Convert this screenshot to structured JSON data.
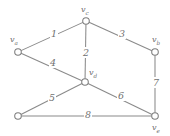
{
  "figure": {
    "kind": "weighted-undirected-graph",
    "background_color": "#ffffff",
    "stroke_color": "#8a8a8a",
    "text_color": "#6f6f6f",
    "width": 170,
    "height": 136
  },
  "vertices": [
    {
      "id": "vc",
      "label_prefix": "v",
      "label_sub": "c",
      "x": 86,
      "y": 21,
      "has_label": true
    },
    {
      "id": "va",
      "label_prefix": "v",
      "label_sub": "a",
      "x": 18,
      "y": 52,
      "has_label": true
    },
    {
      "id": "vb",
      "label_prefix": "v",
      "label_sub": "b",
      "x": 155,
      "y": 52,
      "has_label": true
    },
    {
      "id": "vd",
      "label_prefix": "v",
      "label_sub": "d",
      "x": 85,
      "y": 82,
      "has_label": true
    },
    {
      "id": "vg",
      "label_prefix": "",
      "label_sub": "",
      "x": 18,
      "y": 116,
      "has_label": false
    },
    {
      "id": "ve",
      "label_prefix": "v",
      "label_sub": "e",
      "x": 155,
      "y": 116,
      "has_label": true
    }
  ],
  "vertex_labels": {
    "vc": {
      "text": "v",
      "sub": "c",
      "x": 81,
      "y": 6
    },
    "va": {
      "text": "v",
      "sub": "a",
      "x": 10,
      "y": 36
    },
    "vb": {
      "text": "v",
      "sub": "b",
      "x": 152,
      "y": 36
    },
    "vd": {
      "text": "v",
      "sub": "d",
      "x": 89,
      "y": 69
    },
    "ve": {
      "text": "v",
      "sub": "e",
      "x": 152,
      "y": 124
    }
  },
  "edges": [
    {
      "id": "e1",
      "from": "va",
      "to": "vc",
      "weight": "1",
      "label_x": 50,
      "label_y": 29
    },
    {
      "id": "e2",
      "from": "vc",
      "to": "vd",
      "weight": "2",
      "label_x": 82,
      "label_y": 48
    },
    {
      "id": "e3",
      "from": "vc",
      "to": "vb",
      "weight": "3",
      "label_x": 118,
      "label_y": 29
    },
    {
      "id": "e4",
      "from": "va",
      "to": "vd",
      "weight": "4",
      "label_x": 49,
      "label_y": 58
    },
    {
      "id": "e5",
      "from": "vg",
      "to": "vd",
      "weight": "5",
      "label_x": 48,
      "label_y": 93
    },
    {
      "id": "e6",
      "from": "vd",
      "to": "ve",
      "weight": "6",
      "label_x": 117,
      "label_y": 91
    },
    {
      "id": "e7",
      "from": "vb",
      "to": "ve",
      "weight": "7",
      "label_x": 152,
      "label_y": 78
    },
    {
      "id": "e8",
      "from": "vg",
      "to": "ve",
      "weight": "8",
      "label_x": 84,
      "label_y": 110
    }
  ],
  "chart_data": {
    "type": "diagram",
    "title": "",
    "node_count": 6,
    "edge_count": 8,
    "nodes": [
      "v_a",
      "v_b",
      "v_c",
      "v_d",
      "v_e",
      "unlabeled"
    ],
    "edge_list": [
      {
        "endpoints": [
          "v_a",
          "v_c"
        ],
        "weight": 1
      },
      {
        "endpoints": [
          "v_c",
          "v_d"
        ],
        "weight": 2
      },
      {
        "endpoints": [
          "v_c",
          "v_b"
        ],
        "weight": 3
      },
      {
        "endpoints": [
          "v_a",
          "v_d"
        ],
        "weight": 4
      },
      {
        "endpoints": [
          "unlabeled",
          "v_d"
        ],
        "weight": 5
      },
      {
        "endpoints": [
          "v_d",
          "v_e"
        ],
        "weight": 6
      },
      {
        "endpoints": [
          "v_b",
          "v_e"
        ],
        "weight": 7
      },
      {
        "endpoints": [
          "unlabeled",
          "v_e"
        ],
        "weight": 8
      }
    ]
  }
}
